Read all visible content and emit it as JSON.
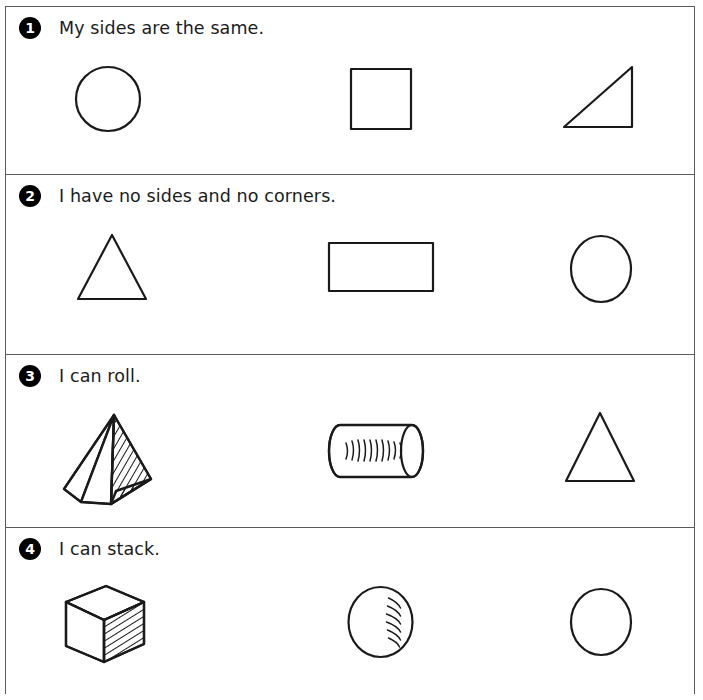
{
  "worksheet": {
    "title": "Shape identification worksheet",
    "frame_color": "#5a5a5a",
    "ink_color": "#1a1a1a",
    "badge_color": "#000000",
    "rows": [
      {
        "number": "1",
        "prompt": "My sides are the same.",
        "shapes": [
          {
            "name": "circle",
            "label": "circle"
          },
          {
            "name": "square",
            "label": "square"
          },
          {
            "name": "right-triangle",
            "label": "right triangle"
          }
        ]
      },
      {
        "number": "2",
        "prompt": "I have no sides and no corners.",
        "shapes": [
          {
            "name": "triangle",
            "label": "triangle"
          },
          {
            "name": "rectangle",
            "label": "rectangle"
          },
          {
            "name": "circle",
            "label": "circle"
          }
        ]
      },
      {
        "number": "3",
        "prompt": "I can roll.",
        "shapes": [
          {
            "name": "pyramid",
            "label": "pyramid"
          },
          {
            "name": "cylinder",
            "label": "cylinder"
          },
          {
            "name": "triangle",
            "label": "triangle"
          }
        ]
      },
      {
        "number": "4",
        "prompt": "I can stack.",
        "shapes": [
          {
            "name": "cube",
            "label": "cube"
          },
          {
            "name": "sphere",
            "label": "sphere"
          },
          {
            "name": "circle",
            "label": "circle"
          }
        ]
      }
    ]
  }
}
